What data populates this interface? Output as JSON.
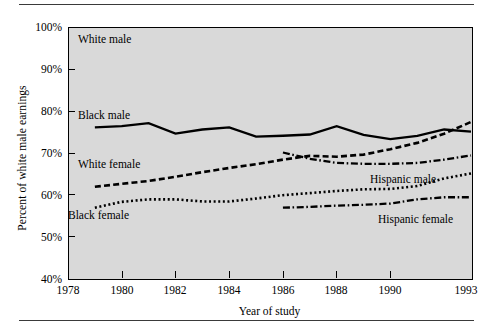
{
  "chart_data": {
    "type": "line",
    "title": "",
    "xlabel": "Year of study",
    "ylabel": "Percent of white male earnings",
    "xlim": [
      1978,
      1993
    ],
    "ylim": [
      40,
      100
    ],
    "grid": false,
    "legend_position": "inline-annotations",
    "x_tick_labels": [
      "1978",
      "1980",
      "1982",
      "1984",
      "1986",
      "1988",
      "1990",
      "1993"
    ],
    "x_tick_values": [
      1978,
      1980,
      1982,
      1984,
      1986,
      1988,
      1990,
      1993
    ],
    "y_tick_labels": [
      "40%",
      "50%",
      "60%",
      "70%",
      "80%",
      "90%",
      "100%"
    ],
    "y_tick_values": [
      40,
      50,
      60,
      70,
      80,
      90,
      100
    ],
    "series": [
      {
        "name": "White male",
        "style": "reference",
        "x": [
          1978,
          1993
        ],
        "values": [
          100,
          100
        ],
        "annotation": "White male"
      },
      {
        "name": "Black male",
        "style": "solid",
        "x": [
          1979,
          1980,
          1981,
          1982,
          1983,
          1984,
          1985,
          1986,
          1987,
          1988,
          1989,
          1990,
          1991,
          1992,
          1993
        ],
        "values": [
          76.0,
          76.3,
          77.0,
          74.5,
          75.5,
          76.0,
          73.8,
          74.0,
          74.3,
          76.3,
          74.2,
          73.2,
          74.0,
          75.5,
          75.0
        ],
        "annotation": "Black male"
      },
      {
        "name": "White female",
        "style": "dashed",
        "x": [
          1979,
          1980,
          1981,
          1982,
          1983,
          1984,
          1985,
          1986,
          1987,
          1988,
          1989,
          1990,
          1991,
          1992,
          1993
        ],
        "values": [
          61.8,
          62.5,
          63.2,
          64.2,
          65.3,
          66.3,
          67.2,
          68.3,
          69.2,
          69.0,
          69.5,
          70.8,
          72.3,
          74.5,
          77.3
        ],
        "annotation": "White female"
      },
      {
        "name": "Black female",
        "style": "dotted",
        "x": [
          1979,
          1980,
          1981,
          1982,
          1983,
          1984,
          1985,
          1986,
          1987,
          1988,
          1989,
          1990,
          1991,
          1992,
          1993
        ],
        "values": [
          56.8,
          58.2,
          58.8,
          58.8,
          58.3,
          58.3,
          59.0,
          59.8,
          60.3,
          60.8,
          61.2,
          61.3,
          62.0,
          63.8,
          65.0
        ],
        "annotation": "Black female"
      },
      {
        "name": "Hispanic male",
        "style": "dash-dot",
        "x": [
          1986,
          1987,
          1988,
          1989,
          1990,
          1991,
          1992,
          1993
        ],
        "values": [
          70.0,
          68.5,
          67.5,
          67.3,
          67.3,
          67.5,
          68.3,
          69.3
        ],
        "annotation": "Hispanic male"
      },
      {
        "name": "Hispanic female",
        "style": "dash-dot",
        "x": [
          1986,
          1987,
          1988,
          1989,
          1990,
          1991,
          1992,
          1993
        ],
        "values": [
          56.8,
          57.0,
          57.3,
          57.5,
          57.8,
          58.8,
          59.3,
          59.3
        ],
        "annotation": "Hispanic female"
      }
    ],
    "colors": {
      "plot_background": "#d9d9d9",
      "page_background": "#ffffff",
      "line": "#000000",
      "axis": "#000000"
    }
  },
  "annotations": {
    "white_male": "White male",
    "black_male": "Black male",
    "white_female": "White female",
    "black_female": "Black female",
    "hispanic_male": "Hispanic male",
    "hispanic_female": "Hispanic female"
  }
}
